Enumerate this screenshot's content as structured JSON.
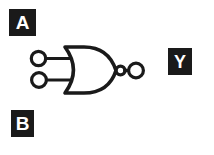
{
  "diagram": {
    "type": "logic-gate-schematic",
    "gate_type": "NOR",
    "background_color": "#ffffff",
    "stroke_color": "#1a1a1a",
    "label_box_color": "#1a1a1a",
    "label_text_color": "#ffffff",
    "labels": {
      "input_a": "A",
      "input_b": "B",
      "output_y": "Y"
    },
    "terminals": {
      "input_a_terminal": "open-circle",
      "input_b_terminal": "open-circle",
      "output_terminal": "open-circle",
      "inversion_bubble": "filled-circle"
    }
  }
}
